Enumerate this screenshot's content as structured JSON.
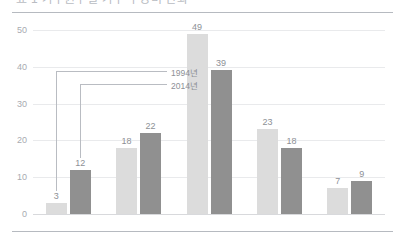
{
  "header": {
    "title_cropped": "표 1 가구원수별 가구 구성비 변화"
  },
  "chart_data": {
    "type": "bar",
    "title": "",
    "xlabel": "",
    "ylabel": "",
    "ylim": [
      0,
      50
    ],
    "yticks": [
      0,
      10,
      20,
      30,
      40,
      50
    ],
    "grid": true,
    "legend_position": "inside-left",
    "categories": [
      "1",
      "2",
      "3",
      "4",
      "5"
    ],
    "series": [
      {
        "name": "1994년",
        "color": "#dcdcdc",
        "values": [
          3,
          18,
          49,
          23,
          7
        ]
      },
      {
        "name": "2014년",
        "color": "#909090",
        "values": [
          12,
          22,
          39,
          18,
          9
        ]
      }
    ]
  },
  "colors": {
    "series_1994": "#dcdcdc",
    "series_2014": "#909090",
    "rule": "#b6bac0",
    "gridline": "#e9eaec",
    "text": "#8d9096",
    "axis_text": "#a8abb1"
  }
}
